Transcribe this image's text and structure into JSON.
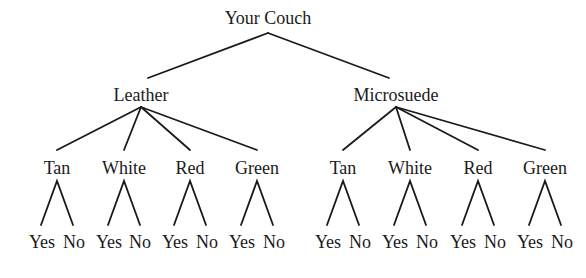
{
  "tree": {
    "root": "Your Couch",
    "materials": [
      {
        "label": "Leather",
        "colors": [
          {
            "label": "Tan",
            "leaves": [
              "Yes",
              "No"
            ]
          },
          {
            "label": "White",
            "leaves": [
              "Yes",
              "No"
            ]
          },
          {
            "label": "Red",
            "leaves": [
              "Yes",
              "No"
            ]
          },
          {
            "label": "Green",
            "leaves": [
              "Yes",
              "No"
            ]
          }
        ]
      },
      {
        "label": "Microsuede",
        "colors": [
          {
            "label": "Tan",
            "leaves": [
              "Yes",
              "No"
            ]
          },
          {
            "label": "White",
            "leaves": [
              "Yes",
              "No"
            ]
          },
          {
            "label": "Red",
            "leaves": [
              "Yes",
              "No"
            ]
          },
          {
            "label": "Green",
            "leaves": [
              "Yes",
              "No"
            ]
          }
        ]
      }
    ]
  }
}
